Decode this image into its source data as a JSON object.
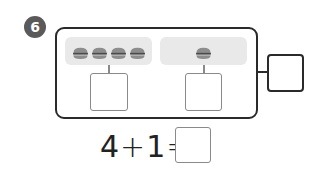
{
  "problem": {
    "number": "6",
    "left_group": {
      "count": 4,
      "item_icon": "burger-icon"
    },
    "right_group": {
      "count": 1,
      "item_icon": "burger-icon"
    },
    "left_answer": "",
    "right_answer": "",
    "total_answer": ""
  },
  "equation": {
    "a": "4",
    "op": "+",
    "b": "1",
    "eq": "=",
    "answer": ""
  },
  "colors": {
    "badge": "#5a5a5a",
    "border": "#2a2a2a",
    "pill": "#e9e9e9",
    "box_border": "#8a8a8a",
    "burger_bun": "#8d8d8d",
    "burger_patty": "#4a4a4a"
  }
}
